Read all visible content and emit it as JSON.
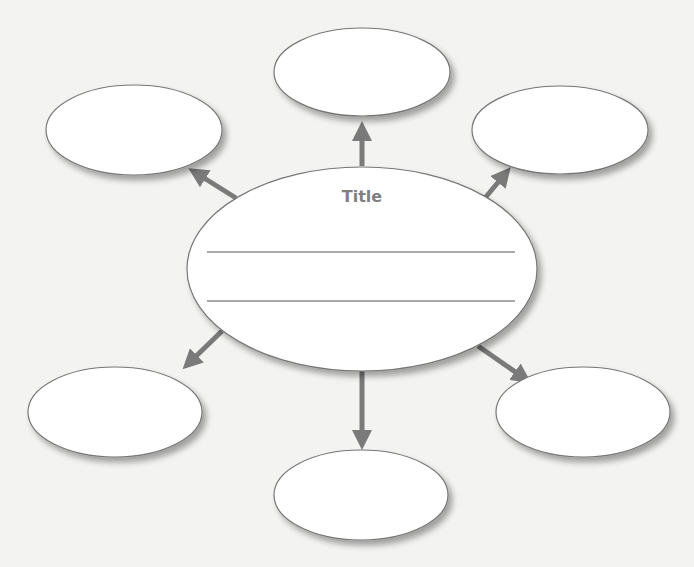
{
  "diagram": {
    "type": "idea-web",
    "center": {
      "title": "Title",
      "cx": 362,
      "cy": 269,
      "rx": 175,
      "ry": 102,
      "lines": [
        {
          "x1": 207,
          "x2": 515,
          "y": 252
        },
        {
          "x1": 207,
          "x2": 515,
          "y": 301
        }
      ]
    },
    "satellites": [
      {
        "id": "top",
        "label": "",
        "cx": 362,
        "cy": 72,
        "rx": 88,
        "ry": 44
      },
      {
        "id": "top-left",
        "label": "",
        "cx": 134,
        "cy": 130,
        "rx": 88,
        "ry": 45
      },
      {
        "id": "top-right",
        "label": "",
        "cx": 560,
        "cy": 130,
        "rx": 88,
        "ry": 44
      },
      {
        "id": "bottom-left",
        "label": "",
        "cx": 115,
        "cy": 412,
        "rx": 87,
        "ry": 45
      },
      {
        "id": "bottom-right",
        "label": "",
        "cx": 583,
        "cy": 412,
        "rx": 87,
        "ry": 45
      },
      {
        "id": "bottom",
        "label": "",
        "cx": 361,
        "cy": 495,
        "rx": 87,
        "ry": 45
      }
    ],
    "arrows": [
      {
        "id": "to-top",
        "x1": 362,
        "y1": 166,
        "x2": 362,
        "y2": 130
      },
      {
        "id": "to-top-left",
        "x1": 236,
        "y1": 198,
        "x2": 196,
        "y2": 173
      },
      {
        "id": "to-top-right",
        "x1": 485,
        "y1": 198,
        "x2": 505,
        "y2": 174
      },
      {
        "id": "to-bottom-left",
        "x1": 222,
        "y1": 331,
        "x2": 189,
        "y2": 363
      },
      {
        "id": "to-bottom-right",
        "x1": 478,
        "y1": 346,
        "x2": 524,
        "y2": 378
      },
      {
        "id": "to-bottom",
        "x1": 362,
        "y1": 371,
        "x2": 362,
        "y2": 441
      }
    ],
    "colors": {
      "background": "#f3f3f1",
      "ellipse_fill": "#ffffff",
      "ellipse_stroke": "#777777",
      "arrow": "#7a7a7a",
      "title": "#7f7f7f",
      "line": "#555555"
    }
  },
  "side_text": ""
}
